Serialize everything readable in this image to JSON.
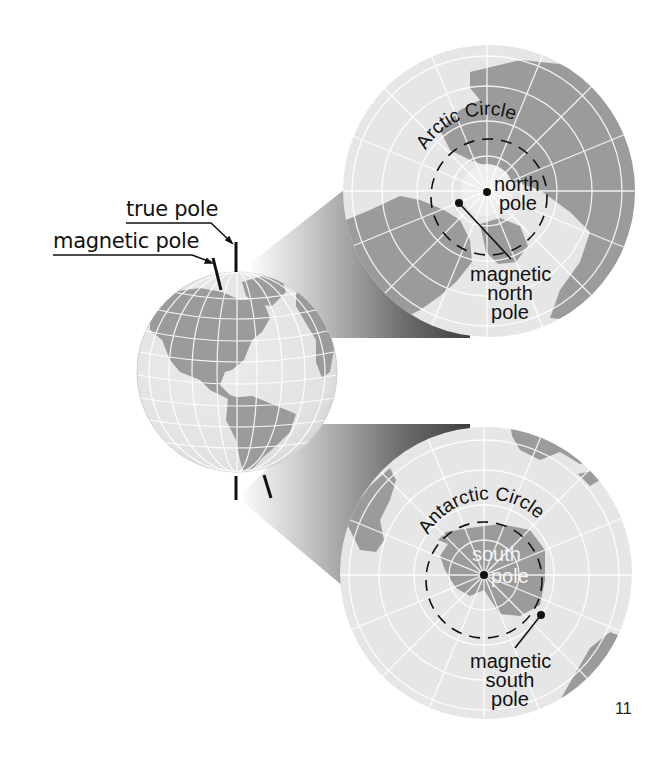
{
  "figure": {
    "page_number": "11",
    "small_globe": {
      "view": "Western Hemisphere (North and South America)",
      "labels": {
        "true_pole": "true pole",
        "magnetic_pole": "magnetic pole"
      }
    },
    "north_inset": {
      "view": "Arctic polar projection",
      "circle_label": "Arctic Circle",
      "pole_label_line1": "north",
      "pole_label_line2": "pole",
      "magnetic_label_line1": "magnetic",
      "magnetic_label_line2": "north",
      "magnetic_label_line3": "pole"
    },
    "south_inset": {
      "view": "Antarctic polar projection",
      "circle_label": "Antarctic Circle",
      "pole_label_line1": "south",
      "pole_label_line2": "pole",
      "magnetic_label_line1": "magnetic",
      "magnetic_label_line2": "south",
      "magnetic_label_line3": "pole"
    },
    "colors": {
      "ocean": "#e6e6e6",
      "land": "#9c9c9c",
      "grid": "#ffffff",
      "band_dark": "#4a4a4a",
      "ink": "#111111"
    }
  }
}
